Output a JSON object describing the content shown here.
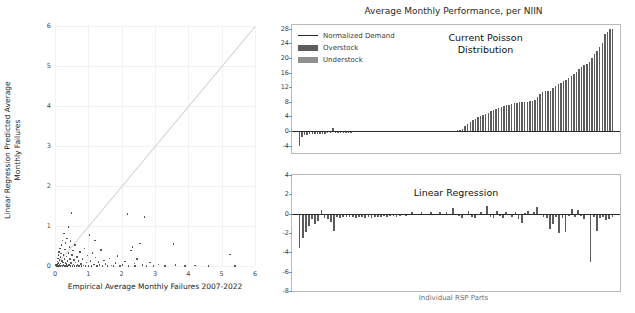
{
  "figure": {
    "width": 635,
    "height": 313,
    "background": "#ffffff"
  },
  "colors": {
    "overstock": "#5c5c5c",
    "understock": "#8f8f8f",
    "normalized_demand_line": "#2b2b2b",
    "scatter_point": "#3a3a3a",
    "reference_line": "#d4d4d4",
    "grid": "#f2f2f2",
    "frame": "#b9b9b9"
  },
  "chart_data": [
    {
      "id": "scatter-panel",
      "type": "scatter",
      "title": "",
      "xlabel": "Empirical Average Monthly Failures 2007-2022",
      "ylabel": "Linear Regression Predicted Average Monthly Failures",
      "xlim": [
        0,
        6
      ],
      "ylim": [
        0,
        6
      ],
      "xticks": [
        0,
        1,
        2,
        3,
        4,
        5,
        6
      ],
      "yticks": [
        0,
        1,
        2,
        3,
        4,
        5,
        6
      ],
      "grid": true,
      "legend_position": "none",
      "annotations": [
        {
          "type": "reference-line",
          "label": "y = x",
          "from": [
            0,
            0
          ],
          "to": [
            6,
            6
          ]
        }
      ],
      "points": [
        [
          0.03,
          0.02
        ],
        [
          0.05,
          0.04
        ],
        [
          0.06,
          0.0
        ],
        [
          0.07,
          0.11
        ],
        [
          0.08,
          0.05
        ],
        [
          0.09,
          0.19
        ],
        [
          0.1,
          0.0
        ],
        [
          0.1,
          0.27
        ],
        [
          0.11,
          0.08
        ],
        [
          0.12,
          0.35
        ],
        [
          0.13,
          0.02
        ],
        [
          0.14,
          0.15
        ],
        [
          0.15,
          0.0
        ],
        [
          0.15,
          0.44
        ],
        [
          0.16,
          0.22
        ],
        [
          0.17,
          0.06
        ],
        [
          0.18,
          0.31
        ],
        [
          0.19,
          0.01
        ],
        [
          0.2,
          0.52
        ],
        [
          0.21,
          0.13
        ],
        [
          0.22,
          0.0
        ],
        [
          0.23,
          0.64
        ],
        [
          0.24,
          0.09
        ],
        [
          0.25,
          0.28
        ],
        [
          0.26,
          0.03
        ],
        [
          0.27,
          0.81
        ],
        [
          0.28,
          0.17
        ],
        [
          0.29,
          0.0
        ],
        [
          0.3,
          0.41
        ],
        [
          0.31,
          0.07
        ],
        [
          0.32,
          0.58
        ],
        [
          0.33,
          0.0
        ],
        [
          0.34,
          0.24
        ],
        [
          0.35,
          0.05
        ],
        [
          0.36,
          0.69
        ],
        [
          0.37,
          0.12
        ],
        [
          0.38,
          0.0
        ],
        [
          0.4,
          0.33
        ],
        [
          0.41,
          0.97
        ],
        [
          0.42,
          0.02
        ],
        [
          0.43,
          0.47
        ],
        [
          0.45,
          0.18
        ],
        [
          0.46,
          0.0
        ],
        [
          0.47,
          0.62
        ],
        [
          0.48,
          0.08
        ],
        [
          0.5,
          1.32
        ],
        [
          0.51,
          0.27
        ],
        [
          0.52,
          0.0
        ],
        [
          0.54,
          0.39
        ],
        [
          0.55,
          0.04
        ],
        [
          0.57,
          0.15
        ],
        [
          0.58,
          0.0
        ],
        [
          0.6,
          0.52
        ],
        [
          0.62,
          0.09
        ],
        [
          0.64,
          0.0
        ],
        [
          0.66,
          0.23
        ],
        [
          0.68,
          0.02
        ],
        [
          0.7,
          0.13
        ],
        [
          0.72,
          0.0
        ],
        [
          0.75,
          0.35
        ],
        [
          0.78,
          0.05
        ],
        [
          0.8,
          0.0
        ],
        [
          0.83,
          0.17
        ],
        [
          0.86,
          0.01
        ],
        [
          0.89,
          0.44
        ],
        [
          0.92,
          0.0
        ],
        [
          0.95,
          0.09
        ],
        [
          0.98,
          0.26
        ],
        [
          1.0,
          0.0
        ],
        [
          1.03,
          0.77
        ],
        [
          1.06,
          0.13
        ],
        [
          1.1,
          0.0
        ],
        [
          1.13,
          0.33
        ],
        [
          1.17,
          0.04
        ],
        [
          1.2,
          0.64
        ],
        [
          1.22,
          0.21
        ],
        [
          1.26,
          0.0
        ],
        [
          1.3,
          0.1
        ],
        [
          1.34,
          0.02
        ],
        [
          1.38,
          0.4
        ],
        [
          1.42,
          0.0
        ],
        [
          1.47,
          0.14
        ],
        [
          1.52,
          0.05
        ],
        [
          1.58,
          0.0
        ],
        [
          1.64,
          0.19
        ],
        [
          1.7,
          0.01
        ],
        [
          1.76,
          0.0
        ],
        [
          1.82,
          0.08
        ],
        [
          1.88,
          0.25
        ],
        [
          1.95,
          0.0
        ],
        [
          2.02,
          0.03
        ],
        [
          2.1,
          0.11
        ],
        [
          2.18,
          1.3
        ],
        [
          2.2,
          0.0
        ],
        [
          2.28,
          0.39
        ],
        [
          2.32,
          0.48
        ],
        [
          2.38,
          0.06
        ],
        [
          2.4,
          0.0
        ],
        [
          2.46,
          0.17
        ],
        [
          2.55,
          0.56
        ],
        [
          2.62,
          0.02
        ],
        [
          2.68,
          1.22
        ],
        [
          2.74,
          0.0
        ],
        [
          2.85,
          0.09
        ],
        [
          2.95,
          0.0
        ],
        [
          3.1,
          0.04
        ],
        [
          3.3,
          0.0
        ],
        [
          3.55,
          0.55
        ],
        [
          3.62,
          0.02
        ],
        [
          3.9,
          0.0
        ],
        [
          4.2,
          0.01
        ],
        [
          4.6,
          0.0
        ],
        [
          5.25,
          0.29
        ],
        [
          5.4,
          0.0
        ]
      ]
    },
    {
      "id": "top-bar-panel",
      "type": "bar",
      "title": "Average Monthly Performance, per NIIN",
      "inner_title": "Current Poisson Distribution",
      "xlabel": "",
      "ylabel": "",
      "ylim": [
        -6,
        29
      ],
      "yticks": [
        -4,
        0,
        4,
        8,
        12,
        16,
        20,
        24,
        28
      ],
      "grid": false,
      "legend_position": "upper left",
      "legend": [
        {
          "label": "Normalized Demand",
          "style": "line",
          "color": "#2b2b2b"
        },
        {
          "label": "Overstock",
          "style": "bar",
          "color": "#5c5c5c"
        },
        {
          "label": "Understock",
          "style": "bar",
          "color": "#8f8f8f"
        }
      ],
      "categories_label": "Individual RSP Parts",
      "values": [
        -4.2,
        -1.5,
        -1.2,
        -1.0,
        -0.9,
        -0.85,
        -0.8,
        -0.8,
        -0.75,
        -0.7,
        -0.7,
        -0.65,
        -0.6,
        0.9,
        -0.55,
        -0.5,
        -0.5,
        -0.45,
        -0.45,
        -0.4,
        -0.4,
        -0.35,
        -0.35,
        -0.3,
        -0.3,
        -0.3,
        -0.25,
        -0.25,
        -0.2,
        -0.2,
        -0.2,
        -0.15,
        -0.15,
        -0.15,
        -0.1,
        -0.1,
        -0.1,
        -0.1,
        -0.05,
        -0.05,
        -0.05,
        -0.05,
        -0.05,
        0.0,
        0.0,
        0.0,
        0.0,
        0.0,
        0.0,
        0.0,
        0.0,
        0.0,
        0.0,
        0.0,
        0.0,
        0.0,
        0.0,
        0.0,
        0.0,
        0.05,
        0.1,
        0.2,
        0.3,
        0.45,
        1.4,
        2.0,
        2.5,
        3.0,
        3.4,
        3.8,
        4.2,
        4.5,
        4.8,
        5.0,
        5.4,
        5.8,
        6.0,
        6.4,
        6.6,
        6.8,
        7.0,
        7.2,
        7.4,
        7.6,
        7.8,
        7.9,
        8.0,
        8.0,
        8.0,
        8.1,
        8.2,
        8.6,
        9.2,
        10.0,
        10.6,
        11.0,
        11.0,
        11.0,
        11.8,
        12.4,
        13.0,
        13.2,
        13.6,
        14.0,
        14.4,
        15.0,
        15.6,
        16.2,
        17.0,
        17.6,
        18.0,
        18.4,
        19.0,
        20.0,
        21.0,
        22.0,
        23.0,
        24.0,
        26.5,
        27.0,
        27.8,
        27.9
      ]
    },
    {
      "id": "bottom-bar-panel",
      "type": "bar",
      "title": "",
      "inner_title": "Linear Regression",
      "xlabel": "Individual RSP Parts",
      "ylabel": "",
      "ylim": [
        -8,
        4
      ],
      "yticks": [
        -8,
        -6,
        -4,
        -2,
        0,
        2,
        4
      ],
      "grid": false,
      "legend_position": "none",
      "values": [
        -3.55,
        -2.55,
        -1.85,
        -1.25,
        -0.55,
        -1.05,
        -0.75,
        0.35,
        -0.45,
        -0.55,
        -0.85,
        -1.75,
        -0.35,
        -0.45,
        -0.3,
        -0.35,
        -0.3,
        -0.35,
        -0.45,
        -0.3,
        -0.35,
        -0.4,
        -0.3,
        -0.45,
        -0.3,
        -0.35,
        -0.3,
        -0.25,
        -0.3,
        -0.2,
        -0.25,
        -0.3,
        -0.2,
        -0.15,
        -0.2,
        -0.1,
        0.2,
        -0.1,
        -0.15,
        0.15,
        -0.05,
        -0.1,
        0.2,
        -0.05,
        -0.1,
        0.15,
        -0.05,
        0.2,
        -0.05,
        0.55,
        -0.05,
        -0.2,
        -0.45,
        -0.1,
        0.25,
        -0.35,
        -0.45,
        -0.05,
        0.2,
        -0.15,
        0.75,
        -0.3,
        -0.45,
        0.25,
        -0.25,
        -0.5,
        0.2,
        -0.1,
        -0.35,
        0.2,
        -0.55,
        -0.95,
        0.1,
        0.3,
        -0.1,
        0.15,
        0.7,
        -0.05,
        -0.3,
        -0.5,
        -1.55,
        -1.1,
        -0.35,
        -1.95,
        -0.4,
        -1.9,
        -0.2,
        0.45,
        -0.3,
        0.4,
        -0.25,
        -0.6,
        -0.15,
        -5.0,
        -0.3,
        -1.8,
        -0.45,
        -0.35,
        -0.7,
        -0.55,
        -0.3
      ]
    }
  ]
}
